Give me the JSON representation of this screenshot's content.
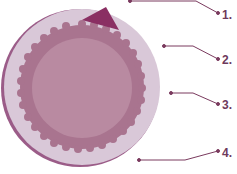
{
  "diagram": {
    "labels": [
      {
        "text": "1.",
        "x": 222,
        "y": 8
      },
      {
        "text": "2.",
        "x": 222,
        "y": 53
      },
      {
        "text": "3.",
        "x": 222,
        "y": 98
      },
      {
        "text": "4.",
        "x": 222,
        "y": 146
      }
    ],
    "colors": {
      "outer_disc": "#d9c8d8",
      "outer_edge": "#9b5c88",
      "scalloped_ring": "#a9748f",
      "inner_disc": "#b98aa1",
      "wedge": "#8a2f63",
      "leader_line": "#7a3a5e"
    }
  }
}
